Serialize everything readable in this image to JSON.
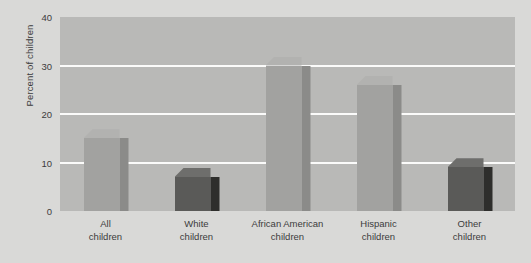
{
  "chart_data": {
    "type": "bar",
    "title": "",
    "xlabel": "",
    "ylabel": "Percent of children",
    "ylim": [
      0,
      40
    ],
    "yticks": [
      0,
      10,
      20,
      30,
      40
    ],
    "grid": true,
    "legend": "none",
    "categories": [
      "All children",
      "White children",
      "African American children",
      "Hispanic children",
      "Other children"
    ],
    "category_lines": [
      [
        "All",
        "children"
      ],
      [
        "White",
        "children"
      ],
      [
        "African American",
        "children"
      ],
      [
        "Hispanic",
        "children"
      ],
      [
        "Other",
        "children"
      ]
    ],
    "values": [
      15,
      7,
      30,
      26,
      9
    ],
    "bar_styles": [
      "light",
      "dark",
      "light",
      "light",
      "dark"
    ],
    "colors": {
      "plot_background": "#b9b9b7",
      "figure_background": "#d9d9d7",
      "gridline": "#fbfbfa",
      "bar_light_front": "#a2a2a0",
      "bar_light_side": "#8b8b89",
      "bar_light_top": "#b2b2b0",
      "bar_dark_front": "#5a5a58",
      "bar_dark_side": "#2e2e2c",
      "bar_dark_top": "#6e6e6c",
      "text": "#3c3c3c"
    }
  }
}
